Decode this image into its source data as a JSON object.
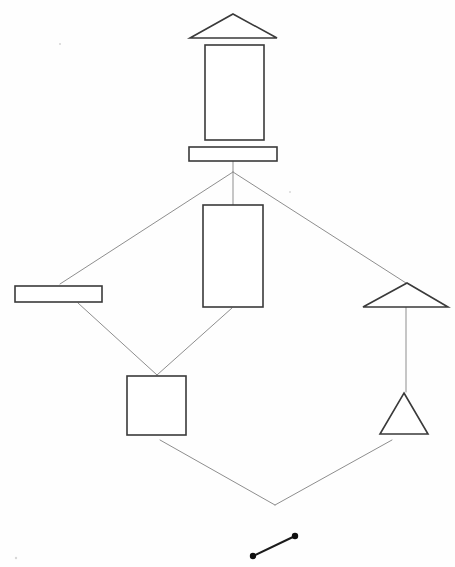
{
  "canvas": {
    "width": 455,
    "height": 567,
    "background_color": "#fefefe",
    "title": "Shape Hierarchy Diagram"
  },
  "style": {
    "shape_stroke_color": "#3a3a3a",
    "shape_fill_color": "#ffffff",
    "connector_stroke_color": "#8e8e8e",
    "segment_stroke_color": "#1b1b1b",
    "dot_color": "#0f0f0f",
    "shape_stroke_width": 1.6,
    "connector_stroke_width": 1.0,
    "segment_stroke_width": 2.0
  },
  "chart_data": {
    "type": "diagram",
    "xlabel": "",
    "ylabel": "",
    "xlim": [
      0,
      455
    ],
    "ylim": [
      0,
      567
    ],
    "grid": false,
    "legend": "none",
    "nodes": [
      {
        "id": "top-triangle",
        "label": "wide flat triangle",
        "shape": "triangle",
        "points": "233,14 277,38 190,38",
        "cx": 233,
        "cy": 30,
        "level": 0
      },
      {
        "id": "top-rectangle",
        "label": "tall rectangle",
        "shape": "rectangle",
        "x": 205,
        "y": 45,
        "width": 59,
        "height": 95,
        "cx": 234,
        "cy": 92,
        "level": 1
      },
      {
        "id": "top-bar",
        "label": "wide horizontal bar",
        "shape": "rectangle",
        "x": 189,
        "y": 147,
        "width": 88,
        "height": 14,
        "cx": 233,
        "cy": 154,
        "level": 2
      },
      {
        "id": "left-bar",
        "label": "left horizontal bar",
        "shape": "rectangle",
        "x": 15,
        "y": 286,
        "width": 87,
        "height": 16,
        "cx": 58,
        "cy": 294,
        "level": 3
      },
      {
        "id": "middle-rectangle",
        "label": "center tall rectangle",
        "shape": "rectangle",
        "x": 203,
        "y": 205,
        "width": 60,
        "height": 102,
        "cx": 233,
        "cy": 256,
        "level": 3
      },
      {
        "id": "right-flat-triangle",
        "label": "right wide flat triangle",
        "shape": "triangle",
        "points": "407,283 448,307 363,307",
        "cx": 406,
        "cy": 299,
        "level": 3
      },
      {
        "id": "bottom-square",
        "label": "square",
        "shape": "square",
        "x": 127,
        "y": 376,
        "width": 59,
        "height": 59,
        "cx": 156,
        "cy": 405,
        "level": 4
      },
      {
        "id": "bottom-triangle",
        "label": "small upright triangle",
        "shape": "triangle",
        "points": "404,393 428,434 380,434",
        "cx": 404,
        "cy": 420,
        "level": 4
      }
    ],
    "junctions": [
      {
        "id": "upper-fan-point",
        "x": 233,
        "y": 172
      },
      {
        "id": "lower-v-point",
        "x": 275,
        "y": 505
      },
      {
        "id": "square-merge-point",
        "x": 157,
        "y": 375
      }
    ],
    "edges": [
      {
        "id": "edge-bar-to-fan",
        "from": "top-bar",
        "to": "upper-fan-point",
        "path": "M 233 161 L 233 172"
      },
      {
        "id": "edge-fan-to-left-bar",
        "from": "upper-fan-point",
        "to": "left-bar",
        "path": "M 233 172 L 60 284"
      },
      {
        "id": "edge-fan-to-middle-rect",
        "from": "upper-fan-point",
        "to": "middle-rectangle",
        "path": "M 233 172 L 233 205"
      },
      {
        "id": "edge-fan-to-right-triangle",
        "from": "upper-fan-point",
        "to": "right-flat-triangle",
        "path": "M 233 172 L 406 283"
      },
      {
        "id": "edge-left-bar-to-square",
        "from": "left-bar",
        "to": "square-merge-point",
        "path": "M 78 303 L 157 375"
      },
      {
        "id": "edge-middle-rect-to-square",
        "from": "middle-rectangle",
        "to": "square-merge-point",
        "path": "M 232 308 L 157 375"
      },
      {
        "id": "edge-right-triangle-to-bottom-triangle",
        "from": "right-flat-triangle",
        "to": "bottom-triangle",
        "path": "M 406 307 L 406 392"
      },
      {
        "id": "edge-square-to-v",
        "from": "bottom-square",
        "to": "lower-v-point",
        "path": "M 160 440 L 275 505"
      },
      {
        "id": "edge-bottom-triangle-to-v",
        "from": "bottom-triangle",
        "to": "lower-v-point",
        "path": "M 392 440 L 275 505"
      }
    ],
    "detached_segment": {
      "id": "bottom-line-segment",
      "label": "line segment with endpoint dots",
      "x1": 253,
      "y1": 556,
      "x2": 295,
      "y2": 536,
      "dot_radius": 3.2
    }
  }
}
